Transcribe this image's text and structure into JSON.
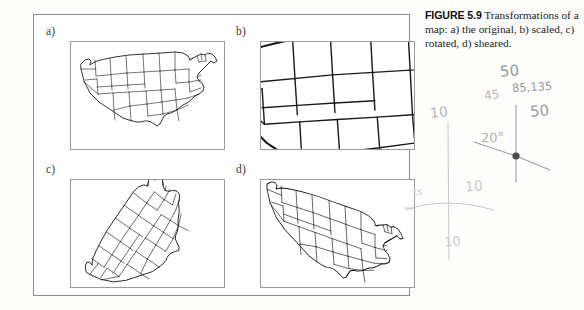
{
  "figure": {
    "caption_number": "FIGURE 5.9",
    "caption_text": " Transformations of a map: a) the original, b) scaled, c) rotated, d) sheared.",
    "panels": [
      {
        "id": "a",
        "label": "a)",
        "name": "original"
      },
      {
        "id": "b",
        "label": "b)",
        "name": "scaled"
      },
      {
        "id": "c",
        "label": "c)",
        "name": "rotated"
      },
      {
        "id": "d",
        "label": "d)",
        "name": "sheared"
      }
    ]
  },
  "annotations": {
    "value_50_top": "50",
    "value_45_left": "45",
    "value_85_135": "85,135",
    "value_50_right": "50",
    "value_20_deg": "20°",
    "value_10_left": "10",
    "value_10_upper": "10",
    "value_10_lower": "10",
    "value_ts": "ts"
  },
  "colors": {
    "page_background": "#fdfdfc",
    "frame_border": "#8b8b8b",
    "map_border": "#9a9a9a",
    "map_stroke": "#1a1a1a",
    "caption_text": "#1c1c1c",
    "pencil": "#9a9a9a"
  }
}
